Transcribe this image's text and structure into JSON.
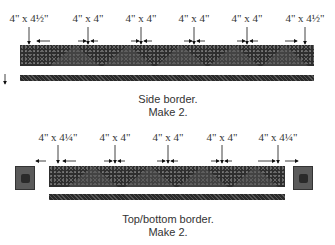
{
  "side_border": {
    "labels": [
      "4\" x 4½\"",
      "4\" x 4\"",
      "4\" x 4\"",
      "4\" x 4\"",
      "4\" x 4\"",
      "4\" x 4½\""
    ],
    "caption_line1": "Side border.",
    "caption_line2": "Make 2."
  },
  "top_bottom_border": {
    "labels": [
      "4\" x 4¼\"",
      "4\" x 4\"",
      "4\" x 4\"",
      "4\" x 4\"",
      "4\" x 4¼\""
    ],
    "caption_line1": "Top/bottom border.",
    "caption_line2": "Make 2."
  }
}
